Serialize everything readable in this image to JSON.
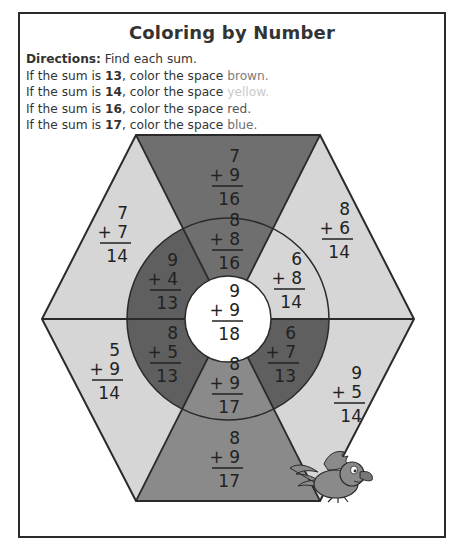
{
  "worksheet": {
    "title": "Coloring by Number",
    "directions_label": "Directions:",
    "directions_text": " Find each sum.",
    "rules": [
      {
        "prefix": "If the sum is ",
        "sum": "13",
        "middle": ", color the space ",
        "color": "brown",
        "suffix": "."
      },
      {
        "prefix": "If the sum is ",
        "sum": "14",
        "middle": ", color the space ",
        "color": "yellow",
        "suffix": "."
      },
      {
        "prefix": "If the sum is ",
        "sum": "16",
        "middle": ", color the space ",
        "color": "red",
        "suffix": "."
      },
      {
        "prefix": "If the sum is ",
        "sum": "17",
        "middle": ", color the space ",
        "color": "blue",
        "suffix": "."
      }
    ]
  },
  "shade_colors": {
    "13": "#5f5f5f",
    "14": "#d6d6d6",
    "16": "#6f6f6f",
    "17": "#8a8a8a",
    "18": "#ffffff",
    "outline": "#2a2a2a"
  },
  "puzzle": {
    "outer_spaces": [
      {
        "position": "top",
        "a": "7",
        "b": "+ 9",
        "sum": "16"
      },
      {
        "position": "upper-right",
        "a": "8",
        "b": "+ 6",
        "sum": "14"
      },
      {
        "position": "lower-right",
        "a": "9",
        "b": "+ 5",
        "sum": "14"
      },
      {
        "position": "bottom",
        "a": "8",
        "b": "+ 9",
        "sum": "17"
      },
      {
        "position": "lower-left",
        "a": "5",
        "b": "+ 9",
        "sum": "14"
      },
      {
        "position": "upper-left",
        "a": "7",
        "b": "+ 7",
        "sum": "14"
      }
    ],
    "ring_spaces": [
      {
        "position": "top",
        "a": "8",
        "b": "+ 8",
        "sum": "16"
      },
      {
        "position": "upper-right",
        "a": "6",
        "b": "+ 8",
        "sum": "14"
      },
      {
        "position": "lower-right",
        "a": "6",
        "b": "+ 7",
        "sum": "13"
      },
      {
        "position": "bottom",
        "a": "8",
        "b": "+ 9",
        "sum": "17"
      },
      {
        "position": "lower-left",
        "a": "8",
        "b": "+ 5",
        "sum": "13"
      },
      {
        "position": "upper-left",
        "a": "9",
        "b": "+ 4",
        "sum": "13"
      }
    ],
    "center_space": {
      "a": "9",
      "b": "+ 9",
      "sum": "18"
    }
  },
  "illustration": {
    "name": "cartoon bird"
  }
}
